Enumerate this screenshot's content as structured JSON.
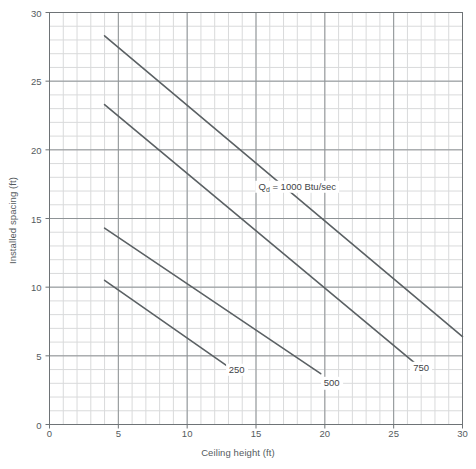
{
  "chart_data": {
    "type": "line",
    "title": "",
    "xlabel": "Ceiling height (ft)",
    "ylabel": "Installed spacing (ft)",
    "xlim": [
      0,
      30
    ],
    "ylim": [
      0,
      30
    ],
    "xticks": [
      0,
      5,
      10,
      15,
      20,
      25,
      30
    ],
    "yticks": [
      0,
      5,
      10,
      15,
      20,
      25,
      30
    ],
    "xtick_labels": [
      "0",
      "5",
      "10",
      "15",
      "20",
      "25",
      "30"
    ],
    "ytick_labels": [
      "0",
      "5",
      "10",
      "15",
      "20",
      "25",
      "30"
    ],
    "grid": true,
    "grid_minor_step": 1,
    "grid_major_step": 5,
    "legend_position": "inline-annotations",
    "line_color": "#5b6164",
    "grid_minor_color": "#d9dadb",
    "grid_major_color": "#8e9396",
    "axis_color": "#6e7376",
    "text_color": "#555b5e",
    "series": [
      {
        "name": "250",
        "label": "250",
        "label_text": "250",
        "x": [
          4.0,
          13.0
        ],
        "y": [
          10.5,
          4.2
        ]
      },
      {
        "name": "500",
        "label": "500",
        "label_text": "500",
        "x": [
          4.0,
          19.7
        ],
        "y": [
          14.3,
          3.7
        ]
      },
      {
        "name": "750",
        "label": "750",
        "label_text": "750",
        "x": [
          4.0,
          26.5
        ],
        "y": [
          23.3,
          4.5
        ]
      },
      {
        "name": "1000",
        "label": "Qd = 1000 Btu/sec",
        "label_text": "Q",
        "label_sub": "d",
        "label_rest": " = 1000 Btu/sec",
        "x": [
          4.0,
          30.0
        ],
        "y": [
          28.3,
          6.4
        ]
      }
    ],
    "annotations": [
      {
        "name": "label-250",
        "text": "250",
        "x": 13.6,
        "y": 4.0
      },
      {
        "name": "label-500",
        "text": "500",
        "x": 20.5,
        "y": 3.0
      },
      {
        "name": "label-750",
        "text": "750",
        "x": 27.0,
        "y": 4.1
      },
      {
        "name": "label-1000",
        "text": "Qd = 1000 Btu/sec",
        "x": 18.0,
        "y": 17.3
      }
    ]
  }
}
